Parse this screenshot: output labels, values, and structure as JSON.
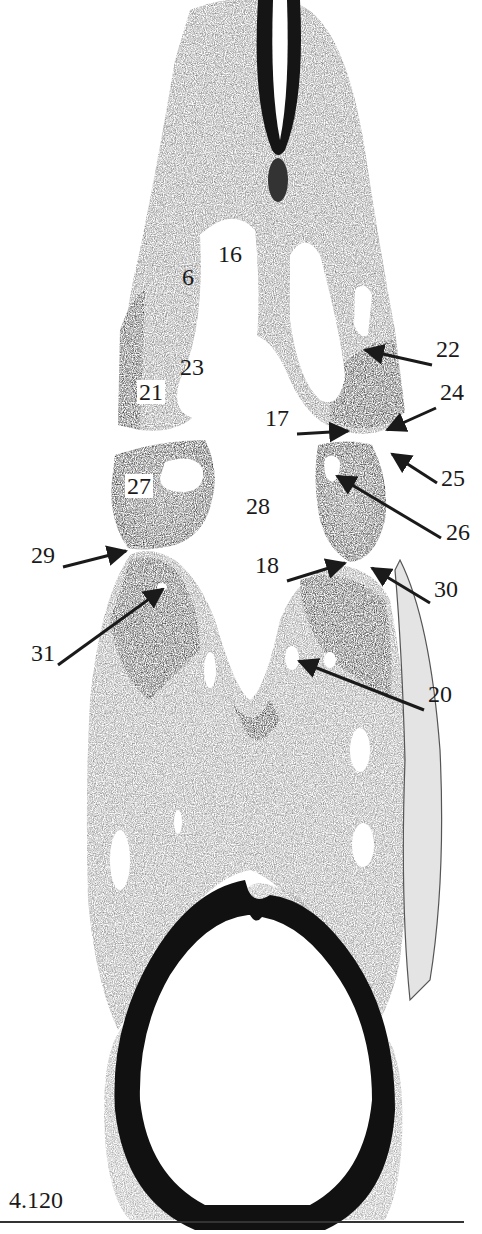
{
  "figure": {
    "number": "4.120",
    "colors": {
      "tissue_dark": "#2a2a2a",
      "tissue_mid": "#6e6e6e",
      "tissue_light": "#b8b8b8",
      "background": "#ffffff",
      "ink": "#1a1a1a"
    }
  },
  "labels": [
    {
      "id": "6",
      "text": "6",
      "x": 182,
      "y": 285,
      "boxed": false
    },
    {
      "id": "16",
      "text": "16",
      "x": 218,
      "y": 262,
      "boxed": false
    },
    {
      "id": "23",
      "text": "23",
      "x": 180,
      "y": 375,
      "boxed": false
    },
    {
      "id": "21",
      "text": "21",
      "x": 137,
      "y": 400,
      "boxed": true
    },
    {
      "id": "22",
      "text": "22",
      "x": 436,
      "y": 357,
      "boxed": false
    },
    {
      "id": "24",
      "text": "24",
      "x": 440,
      "y": 400,
      "boxed": false
    },
    {
      "id": "17",
      "text": "17",
      "x": 265,
      "y": 426,
      "boxed": false
    },
    {
      "id": "25",
      "text": "25",
      "x": 441,
      "y": 486,
      "boxed": false
    },
    {
      "id": "26",
      "text": "26",
      "x": 446,
      "y": 540,
      "boxed": false
    },
    {
      "id": "27",
      "text": "27",
      "x": 125,
      "y": 494,
      "boxed": true
    },
    {
      "id": "28",
      "text": "28",
      "x": 246,
      "y": 514,
      "boxed": false
    },
    {
      "id": "29",
      "text": "29",
      "x": 31,
      "y": 563,
      "boxed": false
    },
    {
      "id": "18",
      "text": "18",
      "x": 255,
      "y": 573,
      "boxed": false
    },
    {
      "id": "30",
      "text": "30",
      "x": 434,
      "y": 597,
      "boxed": false
    },
    {
      "id": "31",
      "text": "31",
      "x": 31,
      "y": 661,
      "boxed": false
    },
    {
      "id": "20",
      "text": "20",
      "x": 428,
      "y": 702,
      "boxed": false
    }
  ],
  "arrows": [
    {
      "for": "22",
      "x1": 432,
      "y1": 365,
      "x2": 365,
      "y2": 350
    },
    {
      "for": "24",
      "x1": 436,
      "y1": 408,
      "x2": 387,
      "y2": 430
    },
    {
      "for": "17",
      "x1": 297,
      "y1": 434,
      "x2": 348,
      "y2": 431
    },
    {
      "for": "25",
      "x1": 437,
      "y1": 483,
      "x2": 392,
      "y2": 454
    },
    {
      "for": "26",
      "x1": 441,
      "y1": 538,
      "x2": 337,
      "y2": 476
    },
    {
      "for": "29",
      "x1": 63,
      "y1": 567,
      "x2": 126,
      "y2": 551
    },
    {
      "for": "18",
      "x1": 287,
      "y1": 581,
      "x2": 345,
      "y2": 563
    },
    {
      "for": "30",
      "x1": 430,
      "y1": 603,
      "x2": 372,
      "y2": 568
    },
    {
      "for": "31",
      "x1": 58,
      "y1": 665,
      "x2": 163,
      "y2": 589
    },
    {
      "for": "20",
      "x1": 424,
      "y1": 710,
      "x2": 299,
      "y2": 661
    }
  ]
}
